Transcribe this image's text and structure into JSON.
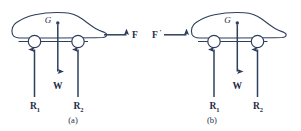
{
  "figure": {
    "stroke_color": "#2e3f5c",
    "text_color": "#1e2c47",
    "background_color": "#ffffff",
    "panels": [
      {
        "id": "a",
        "caption": "(a)",
        "cg_label": "G",
        "applied_force": {
          "label": "F",
          "prime": "",
          "direction": "right",
          "attached_at": "rear",
          "description": "driving force F acting rearward-to-right, arrow pointing right"
        },
        "weight": {
          "label": "W",
          "direction": "down"
        },
        "reactions": [
          {
            "label": "R",
            "subscript": "1",
            "direction": "up",
            "at": "front-wheel"
          },
          {
            "label": "R",
            "subscript": "2",
            "direction": "up",
            "at": "rear-wheel"
          }
        ]
      },
      {
        "id": "b",
        "caption": "(b)",
        "cg_label": "G",
        "applied_force": {
          "label": "F",
          "prime": "'",
          "direction": "right",
          "attached_at": "front",
          "description": "reaction force F-prime acting on the front of the car, arrow pointing right"
        },
        "weight": {
          "label": "W",
          "direction": "down"
        },
        "reactions": [
          {
            "label": "R",
            "subscript": "1",
            "direction": "up",
            "at": "front-wheel"
          },
          {
            "label": "R",
            "subscript": "2",
            "direction": "up",
            "at": "rear-wheel"
          }
        ]
      }
    ]
  }
}
